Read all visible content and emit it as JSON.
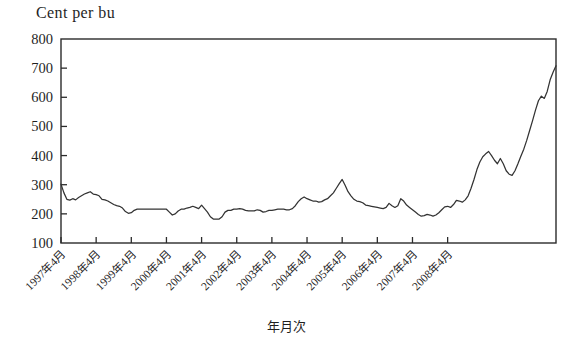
{
  "chart_data": {
    "type": "line",
    "title": "",
    "ylabel": "Cent per bu",
    "xlabel": "年月次",
    "ylim": [
      100,
      800
    ],
    "yticks": [
      100,
      200,
      300,
      400,
      500,
      600,
      700,
      800
    ],
    "grid": false,
    "legend": null,
    "x_tick_labels": [
      "1997年4月",
      "1998年4月",
      "1999年4月",
      "2000年4月",
      "2001年4月",
      "2002年4月",
      "2003年4月",
      "2004年4月",
      "2005年4月",
      "2006年4月",
      "2007年4月",
      "2008年4月"
    ],
    "x_start": "1997-04",
    "x_end": "2008-09",
    "x_interval_months": 1,
    "series": [
      {
        "name": "Corn price",
        "color": "#333333",
        "values": [
          302,
          272,
          250,
          247,
          252,
          248,
          256,
          262,
          268,
          272,
          276,
          268,
          266,
          262,
          250,
          248,
          244,
          238,
          232,
          228,
          226,
          220,
          208,
          202,
          204,
          212,
          216,
          216,
          216,
          216,
          216,
          216,
          216,
          216,
          216,
          216,
          216,
          206,
          196,
          200,
          210,
          216,
          216,
          220,
          222,
          226,
          222,
          218,
          230,
          218,
          206,
          190,
          182,
          182,
          182,
          190,
          206,
          212,
          212,
          216,
          216,
          218,
          216,
          212,
          210,
          210,
          210,
          214,
          212,
          206,
          208,
          212,
          212,
          214,
          216,
          216,
          216,
          214,
          214,
          218,
          228,
          242,
          252,
          258,
          252,
          248,
          244,
          244,
          240,
          242,
          248,
          252,
          262,
          272,
          288,
          304,
          318,
          298,
          276,
          262,
          250,
          244,
          242,
          238,
          230,
          228,
          226,
          224,
          222,
          220,
          218,
          222,
          236,
          228,
          222,
          228,
          252,
          244,
          230,
          222,
          214,
          206,
          198,
          192,
          194,
          198,
          196,
          192,
          196,
          204,
          214,
          224,
          226,
          222,
          232,
          246,
          244,
          240,
          248,
          262,
          288,
          318,
          352,
          378,
          396,
          406,
          414,
          400,
          384,
          372,
          390,
          372,
          348,
          336,
          332,
          348,
          372,
          398,
          422,
          452,
          486,
          520,
          556,
          588,
          604,
          596,
          620,
          660,
          686,
          708
        ]
      }
    ]
  },
  "axes": {
    "y_axis_name": "y-axis",
    "x_axis_name": "x-axis"
  }
}
